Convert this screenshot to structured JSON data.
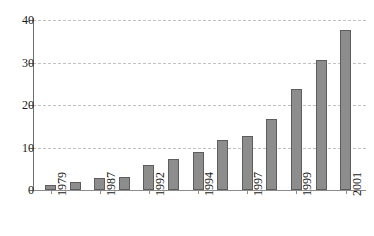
{
  "chart_data": {
    "type": "bar",
    "title": "",
    "subtitle": "",
    "xlabel": "",
    "ylabel": "",
    "ylim": [
      0,
      40
    ],
    "yticks": [
      0,
      10,
      20,
      30,
      40
    ],
    "ytick_labels": [
      "0",
      "10",
      "20",
      "30",
      "40"
    ],
    "grid": true,
    "grid_style": "dashed",
    "legend": "none",
    "categories": [
      "1979",
      "",
      "1987",
      "",
      "1992",
      "",
      "1994",
      "",
      "1997",
      "",
      "1999",
      "",
      "2001"
    ],
    "xtick_labels_visible": [
      "1979",
      "1987",
      "1992",
      "1994",
      "1997",
      "1999",
      "2001"
    ],
    "xtick_label_rotation": 90,
    "values": [
      1.2,
      2.0,
      2.8,
      3.0,
      6.0,
      7.2,
      9.0,
      11.8,
      12.8,
      16.8,
      23.8,
      30.7,
      37.6
    ],
    "bar_color": "#8d8d8d",
    "bar_edge_color": "#5d5d5d",
    "grid_color": "#c0c0c0",
    "axis_color": "#6e6e6e",
    "background_color": "#ffffff"
  }
}
